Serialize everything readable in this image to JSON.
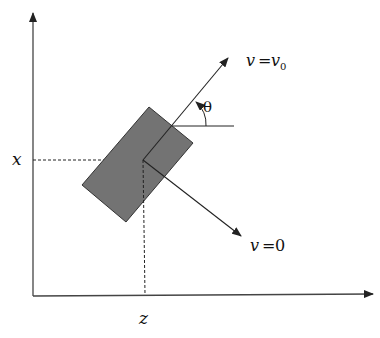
{
  "diagram": {
    "type": "rotated-plate-velocity-diagram",
    "colors": {
      "line": "#222222",
      "plate_fill": "#737373",
      "plate_stroke": "#333333",
      "background": "#ffffff"
    },
    "axes": {
      "vertical_label": "x",
      "horizontal_label": "z"
    },
    "labels": {
      "x_axis": "x",
      "z_axis": "z",
      "angle": "θ",
      "upper_arrow_v": "v",
      "upper_arrow_eq": "=",
      "upper_arrow_v0": "v",
      "upper_arrow_v0_sub": "0",
      "lower_arrow_v": "v",
      "lower_arrow_eq": "=",
      "lower_arrow_val": "0"
    },
    "elements": [
      {
        "name": "vertical-axis",
        "description": "x-axis arrow pointing up"
      },
      {
        "name": "horizontal-axis",
        "description": "z-axis arrow pointing right"
      },
      {
        "name": "plate",
        "description": "gray rotated rectangle (plate) centered at (z, x)"
      },
      {
        "name": "dashed-guide-x",
        "description": "dashed line from x-axis to plate center"
      },
      {
        "name": "dashed-guide-z",
        "description": "dashed line from plate center down to z-axis"
      },
      {
        "name": "velocity-arrow-v0",
        "description": "arrow at angle theta labeled v = v0"
      },
      {
        "name": "velocity-arrow-zero",
        "description": "perpendicular arrow labeled v = 0"
      },
      {
        "name": "reference-line",
        "description": "horizontal reference line for angle theta"
      },
      {
        "name": "angle-arc",
        "description": "arc showing angle theta"
      }
    ]
  }
}
